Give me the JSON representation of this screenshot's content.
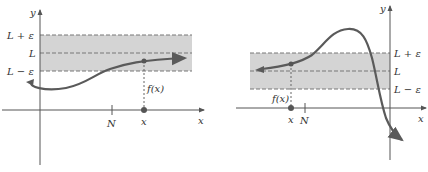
{
  "colors": {
    "band": "#d4d4d4",
    "curve": "#5a5a5a",
    "axis": "#555555",
    "dash": "#777777",
    "text": "#333333"
  },
  "left_panel": {
    "y_axis_label": "y",
    "x_axis_label": "x",
    "band_labels": {
      "upper": "L + ε",
      "middle": "L",
      "lower": "L − ε"
    },
    "tick_N_label": "N",
    "point_x_label": "x",
    "fx_label": "f(x)"
  },
  "right_panel": {
    "y_axis_label": "y",
    "x_axis_label": "x",
    "band_labels": {
      "upper": "L + ε",
      "middle": "L",
      "lower": "L − ε"
    },
    "tick_N_label": "N",
    "point_x_label": "x",
    "fx_label": "f(x)"
  }
}
